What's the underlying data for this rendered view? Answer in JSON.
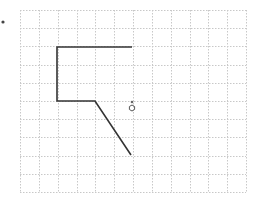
{
  "canvas": {
    "width": 257,
    "height": 207,
    "background": "#ffffff"
  },
  "grid": {
    "left": 20,
    "top": 10,
    "right": 246,
    "bottom": 192,
    "columns": 12,
    "rows": 10,
    "color": "#c8c8c8",
    "style": "dotted"
  },
  "path": {
    "color": "#333333",
    "points": [
      [
        132,
        47
      ],
      [
        57,
        47
      ],
      [
        57,
        101
      ],
      [
        95,
        101
      ],
      [
        131,
        155
      ]
    ]
  },
  "markers": {
    "origin_dot": {
      "x": 3,
      "y": 22,
      "r": 1.6,
      "color": "#444444"
    },
    "small_dot": {
      "x": 132,
      "y": 102,
      "r": 1.3,
      "color": "#666666"
    },
    "turtle_marker": {
      "x": 132,
      "y": 108,
      "r": 3,
      "color": "#555555",
      "shape": "hexagon-outline"
    }
  }
}
